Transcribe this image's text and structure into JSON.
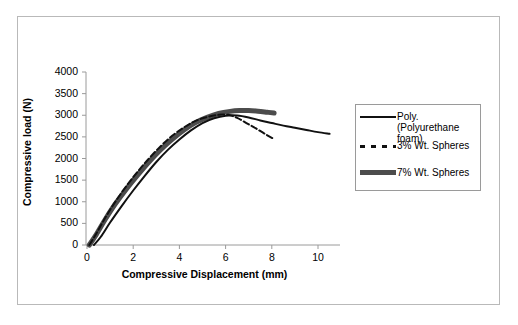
{
  "chart_data": {
    "type": "line",
    "title": "",
    "xlabel": "Compressive Displacement (mm)",
    "ylabel": "Compressive load (N)",
    "xlim": [
      0,
      11
    ],
    "ylim": [
      0,
      4000
    ],
    "xticks": [
      0,
      2,
      4,
      6,
      8,
      10
    ],
    "yticks": [
      0,
      500,
      1000,
      1500,
      2000,
      2500,
      3000,
      3500,
      4000
    ],
    "grid": false,
    "legend_position": "right",
    "series": [
      {
        "name": "Poly. (Polyurethane foam)",
        "style": "solid",
        "color": "#111111",
        "width": 2,
        "x": [
          0.3,
          0.6,
          1.0,
          1.5,
          2.0,
          2.5,
          3.0,
          3.5,
          4.0,
          4.5,
          5.0,
          5.5,
          6.0,
          6.5,
          7.0,
          7.5,
          8.0,
          8.5,
          9.0,
          9.5,
          10.0,
          10.5
        ],
        "y": [
          0,
          190,
          520,
          900,
          1260,
          1600,
          1920,
          2200,
          2440,
          2650,
          2820,
          2930,
          2990,
          2995,
          2950,
          2880,
          2820,
          2760,
          2710,
          2660,
          2610,
          2570
        ]
      },
      {
        "name": "3% Wt. Spheres",
        "style": "dashed",
        "color": "#111111",
        "width": 2,
        "x": [
          0.1,
          0.4,
          0.8,
          1.2,
          1.7,
          2.2,
          2.7,
          3.2,
          3.7,
          4.2,
          4.7,
          5.2,
          5.7,
          6.1,
          6.5,
          6.9,
          7.3,
          7.7,
          8.1
        ],
        "y": [
          0,
          260,
          640,
          980,
          1360,
          1700,
          2010,
          2290,
          2530,
          2720,
          2870,
          2960,
          3010,
          3010,
          2940,
          2820,
          2700,
          2570,
          2450
        ]
      },
      {
        "name": "7% Wt. Spheres",
        "style": "thick",
        "color": "#4c4c4c",
        "width": 5,
        "x": [
          0.1,
          0.4,
          0.8,
          1.2,
          1.7,
          2.2,
          2.7,
          3.2,
          3.7,
          4.2,
          4.7,
          5.2,
          5.7,
          6.2,
          6.6,
          7.0,
          7.4,
          7.8,
          8.1
        ],
        "y": [
          0,
          240,
          600,
          930,
          1290,
          1620,
          1930,
          2210,
          2450,
          2660,
          2830,
          2950,
          3040,
          3090,
          3110,
          3110,
          3095,
          3070,
          3050
        ]
      }
    ]
  },
  "axes": {
    "y_tick_labels": [
      "4000",
      "3500",
      "3000",
      "2500",
      "2000",
      "1500",
      "1000",
      "500",
      "0"
    ],
    "x_tick_labels": [
      "0",
      "2",
      "4",
      "6",
      "8",
      "10"
    ],
    "x_axis_title": "Compressive Displacement (mm)",
    "y_axis_title": "Compressive load (N)"
  },
  "legend": {
    "entries": [
      {
        "label": "Poly. (Polyurethane foam)",
        "style": "solid"
      },
      {
        "label": "3% Wt. Spheres",
        "style": "dashed"
      },
      {
        "label": "7% Wt. Spheres",
        "style": "thick"
      }
    ]
  },
  "colors": {
    "series_black": "#111111",
    "series_gray": "#4c4c4c",
    "axis": "#9a9a9a",
    "border": "#b9b9b9",
    "background": "#ffffff"
  }
}
